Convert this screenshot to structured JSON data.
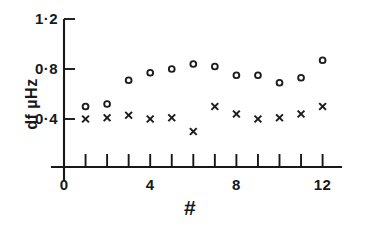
{
  "chart_data": {
    "type": "scatter",
    "title": "",
    "xlabel": "#",
    "ylabel": "df  µHz",
    "x": [
      1,
      2,
      3,
      4,
      5,
      6,
      7,
      8,
      9,
      10,
      11,
      12
    ],
    "xlim": [
      0,
      12.6
    ],
    "ylim": [
      0,
      1.2
    ],
    "grid": false,
    "legend": "none",
    "xticks": [
      0,
      1,
      2,
      3,
      4,
      5,
      6,
      7,
      8,
      9,
      10,
      11,
      12
    ],
    "xtick_labels": [
      "0",
      "",
      "",
      "",
      "4",
      "",
      "",
      "",
      "8",
      "",
      "",
      "",
      "12"
    ],
    "yticks": [
      0.4,
      0.8,
      1.2
    ],
    "ytick_labels": [
      "0·4",
      "0·8",
      "1·2"
    ],
    "series": [
      {
        "name": "circles",
        "marker": "circle",
        "values": [
          0.5,
          0.52,
          0.71,
          0.77,
          0.8,
          0.84,
          0.82,
          0.75,
          0.75,
          0.69,
          0.73,
          0.87
        ]
      },
      {
        "name": "crosses",
        "marker": "x",
        "values": [
          0.4,
          0.41,
          0.43,
          0.4,
          0.41,
          0.3,
          0.5,
          0.44,
          0.4,
          0.41,
          0.44,
          0.5
        ]
      }
    ]
  },
  "axis_titles": {
    "y": "df  µHz",
    "x": "#"
  }
}
